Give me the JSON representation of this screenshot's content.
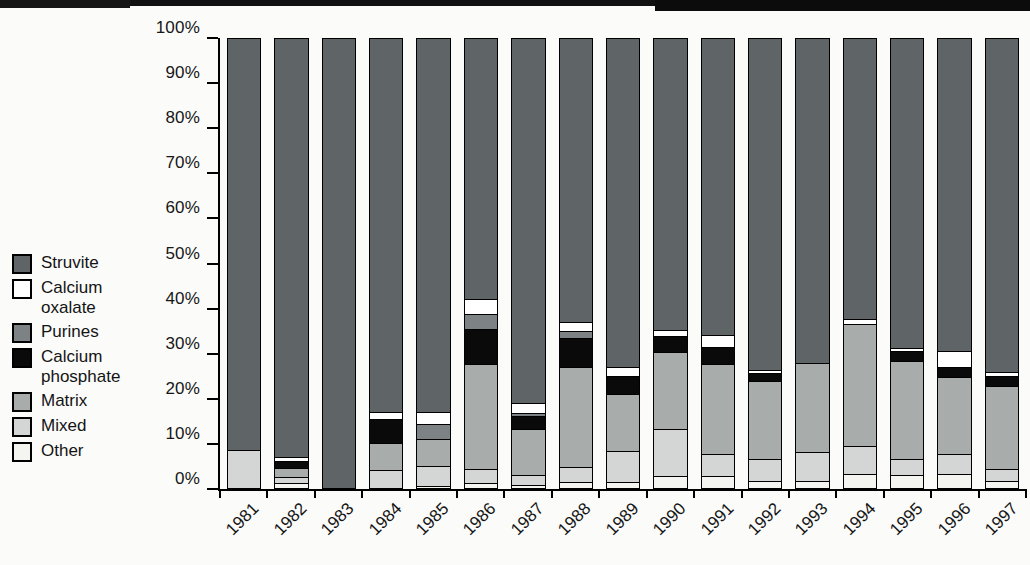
{
  "figure": {
    "background": "#fbfbfa",
    "axis_color": "#000000",
    "scan_artifact": "black strip along top edge"
  },
  "chart_data": {
    "type": "bar",
    "variant": "100-percent-stacked-vertical",
    "title": "",
    "xlabel": "",
    "ylabel": "",
    "ylim": [
      0,
      100
    ],
    "grid": false,
    "legend_position": "left-middle",
    "y_tick_labels": [
      "0%",
      "10%",
      "20%",
      "30%",
      "40%",
      "50%",
      "60%",
      "70%",
      "80%",
      "90%",
      "100%"
    ],
    "categories": [
      "1981",
      "1982",
      "1983",
      "1984",
      "1985",
      "1986",
      "1987",
      "1988",
      "1989",
      "1990",
      "1991",
      "1992",
      "1993",
      "1994",
      "1995",
      "1996",
      "1997"
    ],
    "stack_order_bottom_to_top": [
      "Other",
      "Mixed",
      "Matrix",
      "Calcium phosphate",
      "Purines",
      "Calcium oxalate",
      "Struvite"
    ],
    "series": [
      {
        "name": "Other",
        "color": "#f4f4f1",
        "values": [
          0,
          1,
          0,
          0,
          0.5,
          1,
          0.6,
          1.3,
          1.3,
          2.7,
          2.7,
          1.5,
          1.5,
          3.1,
          3.0,
          3.1,
          1.6
        ]
      },
      {
        "name": "Mixed",
        "color": "#d3d6d4",
        "values": [
          8.5,
          1.5,
          0,
          4.0,
          4.5,
          3.2,
          2.2,
          3.4,
          6.9,
          10.4,
          4.9,
          5.0,
          6.5,
          6.3,
          3.5,
          4.5,
          2.6
        ]
      },
      {
        "name": "Matrix",
        "color": "#a8acab",
        "values": [
          0,
          2.0,
          0,
          6.0,
          6.0,
          23.4,
          10.3,
          22.3,
          12.7,
          17.1,
          20.0,
          17.3,
          19.8,
          27.1,
          21.8,
          17.1,
          18.5
        ]
      },
      {
        "name": "Calcium phosphate",
        "color": "#0a0a0a",
        "values": [
          0,
          1.5,
          0,
          5.3,
          0,
          7.8,
          2.9,
          6.5,
          4.1,
          3.6,
          3.8,
          1.7,
          0,
          0,
          2.2,
          2.3,
          2.3
        ]
      },
      {
        "name": "Purines",
        "color": "#7d8284",
        "values": [
          0,
          0,
          0,
          0,
          3.3,
          3.3,
          0.7,
          1.5,
          0,
          0,
          0,
          0,
          0,
          0,
          0,
          0,
          0
        ]
      },
      {
        "name": "Calcium oxalate",
        "color": "#ffffff",
        "values": [
          0,
          1.0,
          0,
          1.7,
          2.7,
          3.4,
          2.3,
          2.0,
          2.0,
          1.5,
          2.6,
          0.8,
          0,
          1.1,
          0.7,
          3.6,
          0.8
        ]
      },
      {
        "name": "Struvite",
        "color": "#5f6466",
        "values": [
          91.5,
          93.0,
          100,
          83.0,
          83.0,
          57.9,
          81.0,
          63.0,
          73.0,
          64.7,
          66.0,
          73.7,
          72.2,
          62.4,
          68.8,
          69.4,
          74.2
        ]
      }
    ]
  },
  "legend": {
    "items": [
      {
        "label": "Struvite",
        "series": "Struvite"
      },
      {
        "label": "Calcium oxalate",
        "series": "Calcium oxalate"
      },
      {
        "label": "Purines",
        "series": "Purines"
      },
      {
        "label": "Calcium phosphate",
        "series": "Calcium phosphate"
      },
      {
        "label": "Matrix",
        "series": "Matrix"
      },
      {
        "label": "Mixed",
        "series": "Mixed"
      },
      {
        "label": "Other",
        "series": "Other"
      }
    ]
  }
}
